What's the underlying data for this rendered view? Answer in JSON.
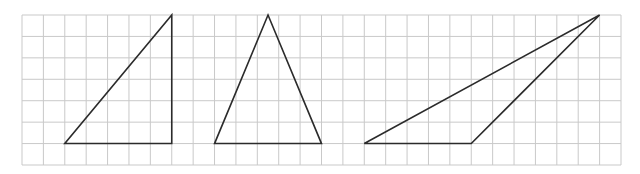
{
  "diagram": {
    "type": "grid-with-triangles",
    "grid": {
      "columns": 28,
      "rows": 7,
      "line_color": "#c9c9c9"
    },
    "stroke_color": "#2b2b2b",
    "shapes": [
      {
        "name": "right-triangle",
        "vertices": [
          [
            2,
            6
          ],
          [
            7,
            6
          ],
          [
            7,
            0
          ]
        ]
      },
      {
        "name": "isosceles-triangle",
        "vertices": [
          [
            9,
            6
          ],
          [
            14,
            6
          ],
          [
            11.5,
            0
          ]
        ]
      },
      {
        "name": "obtuse-triangle",
        "vertices": [
          [
            16,
            6
          ],
          [
            21,
            6
          ],
          [
            27,
            0
          ]
        ]
      }
    ]
  }
}
